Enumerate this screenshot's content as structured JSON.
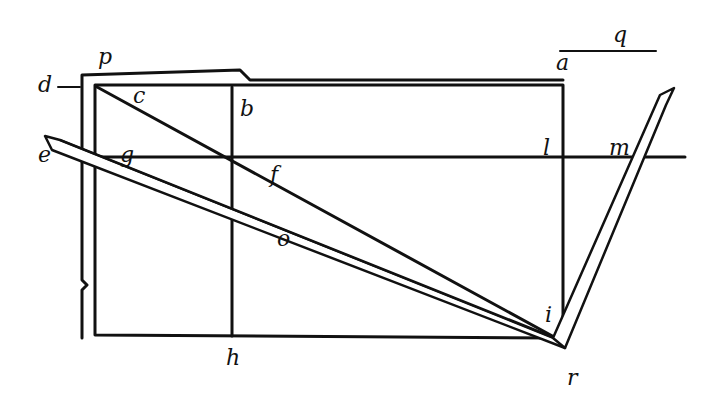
{
  "figure": {
    "type": "geometric woodcut diagram",
    "labels": {
      "d": "d",
      "p": "p",
      "c": "c",
      "b": "b",
      "a": "a",
      "q": "q",
      "e": "e",
      "g": "g",
      "f": "f",
      "l": "l",
      "m": "m",
      "o": "o",
      "i": "i",
      "h": "h",
      "r": "r"
    },
    "colors": {
      "ink": "#111111",
      "paper": "#ffffff"
    }
  }
}
